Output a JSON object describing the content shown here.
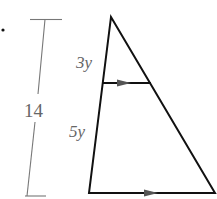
{
  "diagram": {
    "type": "triangle-proportion",
    "bullet": "•",
    "dimension": {
      "label": "14"
    },
    "segments": {
      "upper_left": "3y",
      "lower_left": "5y"
    },
    "parallel_marks": [
      "midline-arrow",
      "base-arrow"
    ],
    "colors": {
      "triangle": "#111111",
      "dimension_line": "#777777",
      "labels": "#666666"
    }
  }
}
